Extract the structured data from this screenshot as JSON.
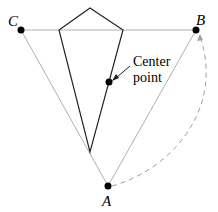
{
  "diagram": {
    "points": {
      "A": {
        "label": "A",
        "x": 108,
        "y": 186
      },
      "B": {
        "label": "B",
        "x": 196,
        "y": 30
      },
      "C": {
        "label": "C",
        "x": 21,
        "y": 30
      },
      "center": {
        "label_line1": "Center",
        "label_line2": "point",
        "x": 109,
        "y": 82
      }
    },
    "kite": {
      "top": [
        90,
        8
      ],
      "left": [
        59,
        30
      ],
      "right": [
        123,
        30
      ],
      "bottom": [
        90,
        152
      ]
    },
    "colors": {
      "triangle": "#b0b0b0",
      "kite": "#222222",
      "dot": "#000000",
      "arc": "#a0a0a0"
    }
  }
}
